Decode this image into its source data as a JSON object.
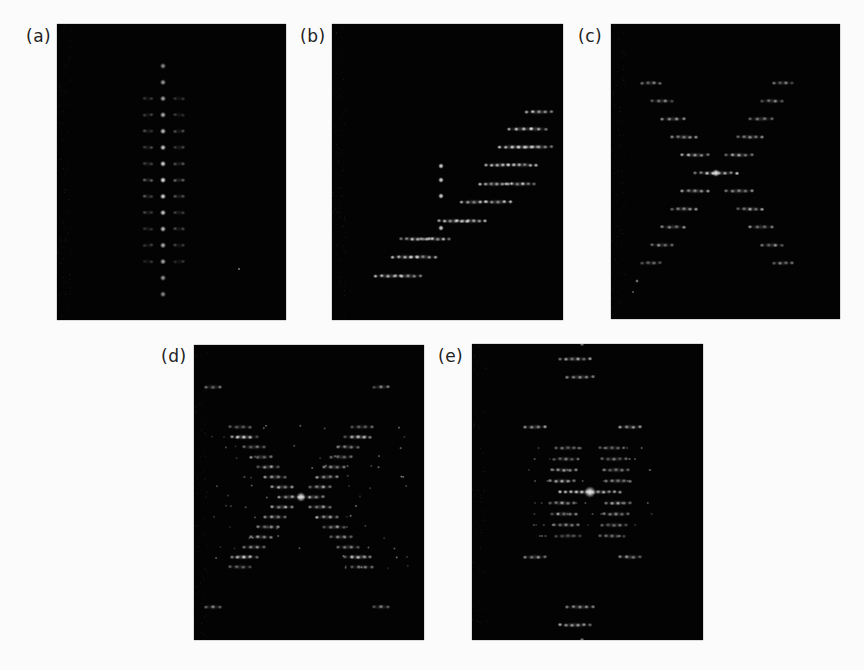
{
  "figure": {
    "background": "#fbfbfb",
    "panel_background": "#030303",
    "spot_color": "#ffffff",
    "panels": [
      {
        "id": "a",
        "label": "(a)",
        "x": 57,
        "y": 24,
        "w": 229,
        "h": 296,
        "label_x": 26,
        "label_y": 28,
        "pattern": "vertical-line",
        "center": [
          106,
          150
        ]
      },
      {
        "id": "b",
        "label": "(b)",
        "x": 332,
        "y": 24,
        "w": 231,
        "h": 296,
        "label_x": 300,
        "label_y": 28,
        "pattern": "diagonal-band",
        "center": [
          109,
          140
        ]
      },
      {
        "id": "c",
        "label": "(c)",
        "x": 611,
        "y": 24,
        "w": 229,
        "h": 295,
        "label_x": 578,
        "label_y": 28,
        "pattern": "x-cross",
        "center": [
          105,
          149
        ]
      },
      {
        "id": "d",
        "label": "(d)",
        "x": 194,
        "y": 345,
        "w": 230,
        "h": 295,
        "label_x": 161,
        "label_y": 348,
        "pattern": "x-cross-dense",
        "center": [
          107,
          152
        ]
      },
      {
        "id": "e",
        "label": "(e)",
        "x": 472,
        "y": 344,
        "w": 231,
        "h": 296,
        "label_x": 438,
        "label_y": 348,
        "pattern": "diamond-star",
        "center": [
          118,
          148
        ]
      }
    ]
  }
}
